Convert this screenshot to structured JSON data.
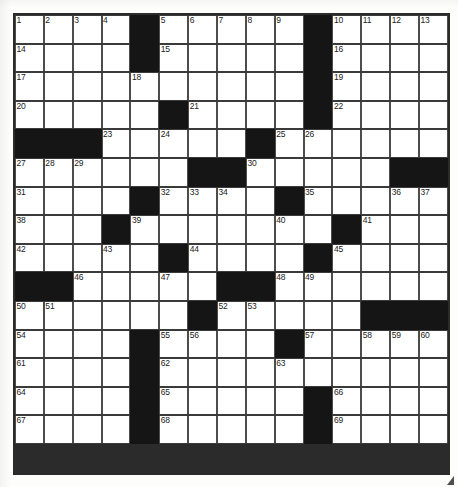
{
  "puzzle": {
    "title": "Crossword Puzzle Grid",
    "rows": 16,
    "columns": 15,
    "ink_color": "#151515",
    "cell_color": "#ffffff",
    "line_color": "#3a3a3a",
    "grid": [
      [
        "n1",
        "n2",
        "n3",
        "n4",
        "#",
        "n5",
        "n6",
        "n7",
        "n8",
        "n9",
        "#",
        "n10",
        "n11",
        "n12",
        "n13"
      ],
      [
        "n14",
        "",
        "",
        "",
        "#",
        "n15",
        "",
        "",
        "",
        "",
        "#",
        "n16",
        "",
        "",
        ""
      ],
      [
        "n17",
        "",
        "",
        "",
        "n18",
        "",
        "",
        "",
        "",
        "",
        "#",
        "n19",
        "",
        "",
        ""
      ],
      [
        "n20",
        "",
        "",
        "",
        "",
        "#",
        "n21",
        "",
        "",
        "",
        "#",
        "n22",
        "",
        "",
        ""
      ],
      [
        "#",
        "#",
        "#",
        "n23",
        "",
        "n24",
        "",
        "",
        "#",
        "n25",
        "n26",
        "",
        "",
        "",
        ""
      ],
      [
        "n27",
        "n28",
        "n29",
        "",
        "",
        "",
        "#",
        "#",
        "n30",
        "",
        "",
        "",
        "",
        "#",
        "#"
      ],
      [
        "n31",
        "",
        "",
        "",
        "#",
        "n32",
        "n33",
        "n34",
        "",
        "#",
        "n35",
        "",
        "",
        "n36",
        "n37"
      ],
      [
        "n38",
        "",
        "",
        "#",
        "n39",
        "",
        "",
        "",
        "",
        "n40",
        "",
        "#",
        "n41",
        "",
        ""
      ],
      [
        "n42",
        "",
        "",
        "n43",
        "",
        "#",
        "n44",
        "",
        "",
        "",
        "#",
        "n45",
        "",
        "",
        ""
      ],
      [
        "#",
        "#",
        "n46",
        "",
        "",
        "n47",
        "",
        "#",
        "#",
        "n48",
        "n49",
        "",
        "",
        "",
        ""
      ],
      [
        "n50",
        "n51",
        "",
        "",
        "",
        "",
        "#",
        "n52",
        "n53",
        "",
        "",
        "",
        "#",
        "#",
        "#"
      ],
      [
        "n54",
        "",
        "",
        "",
        "#",
        "n55",
        "n56",
        "",
        "",
        "#",
        "n57",
        "",
        "n58",
        "n59",
        "n60"
      ],
      [
        "n61",
        "",
        "",
        "",
        "#",
        "n62",
        "",
        "",
        "",
        "n63",
        "",
        "",
        "",
        "",
        ""
      ],
      [
        "n64",
        "",
        "",
        "",
        "#",
        "n65",
        "",
        "",
        "",
        "",
        "#",
        "n66",
        "",
        "",
        ""
      ],
      [
        "n67",
        "",
        "",
        "",
        "#",
        "n68",
        "",
        "",
        "",
        "",
        "#",
        "n69",
        "",
        "",
        ""
      ]
    ],
    "numbers_present": [
      "1",
      "2",
      "3",
      "4",
      "5",
      "6",
      "7",
      "8",
      "9",
      "10",
      "11",
      "12",
      "13",
      "14",
      "15",
      "16",
      "17",
      "18",
      "19",
      "20",
      "21",
      "22",
      "23",
      "24",
      "25",
      "26",
      "27",
      "28",
      "29",
      "30",
      "31",
      "32",
      "33",
      "34",
      "35",
      "36",
      "37",
      "38",
      "39",
      "40",
      "41",
      "42",
      "43",
      "44",
      "45",
      "46",
      "47",
      "48",
      "49",
      "50",
      "51",
      "52",
      "53",
      "54",
      "55",
      "56",
      "57",
      "58",
      "59",
      "60",
      "61",
      "62",
      "63",
      "64",
      "65",
      "66",
      "67",
      "68",
      "69"
    ]
  }
}
